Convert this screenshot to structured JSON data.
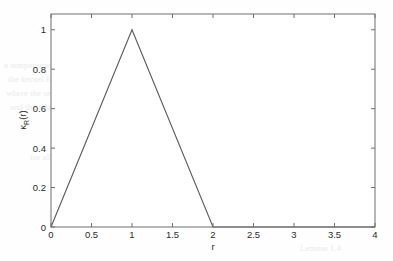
{
  "figure": {
    "background_color": "#fefefe",
    "line_color": "#5a5a5a",
    "axis_color": "#6f6f6f",
    "text_color": "#2b2b2b"
  },
  "bleed_through": [
    {
      "text": "Bernoulli Coupling",
      "x": 196,
      "y": 38,
      "size": 12
    },
    {
      "text": "a nonparametric copula estimator",
      "x": 4,
      "y": 60,
      "size": 9
    },
    {
      "text": "the kernel function with bandwidth",
      "x": 8,
      "y": 74,
      "size": 9
    },
    {
      "text": "where the smoothing parameter is",
      "x": 6,
      "y": 88,
      "size": 9
    },
    {
      "text": "and the resulting density estimate",
      "x": 10,
      "y": 102,
      "size": 9
    },
    {
      "text": "for all values of the argument",
      "x": 30,
      "y": 152,
      "size": 9
    },
    {
      "text": "Lemma 1.4",
      "x": 300,
      "y": 243,
      "size": 9
    }
  ],
  "chart_data": {
    "type": "line",
    "title": "",
    "xlabel": "r",
    "ylabel": "κ_R(r)",
    "ylabel_display": "κ",
    "ylabel_subscript": "R",
    "ylabel_suffix": "(r)",
    "xlim": [
      0,
      4
    ],
    "ylim": [
      0,
      1.08
    ],
    "xticks": [
      0,
      0.5,
      1,
      1.5,
      2,
      2.5,
      3,
      3.5,
      4
    ],
    "xticklabels": [
      "0",
      "0.5",
      "1",
      "1.5",
      "2",
      "2.5",
      "3",
      "3.5",
      "4"
    ],
    "yticks": [
      0,
      0.2,
      0.4,
      0.6,
      0.8,
      1
    ],
    "yticklabels": [
      "0",
      "0.2",
      "0.4",
      "0.6",
      "0.8",
      "1"
    ],
    "grid": false,
    "legend": null,
    "box": true,
    "tick_direction": "in",
    "series": [
      {
        "name": "kappa_R",
        "x": [
          0,
          1,
          2,
          4
        ],
        "y": [
          0,
          1,
          0,
          0
        ]
      }
    ]
  },
  "plot_geometry": {
    "left": 51,
    "top": 14,
    "right": 375,
    "bottom": 227
  }
}
